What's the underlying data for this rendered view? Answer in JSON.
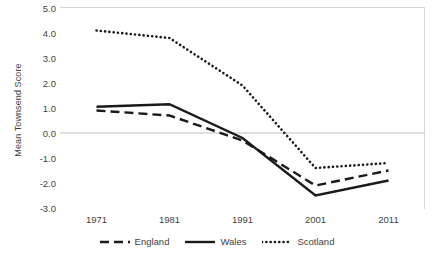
{
  "chart_data": {
    "type": "line",
    "title": "",
    "xlabel": "",
    "ylabel": "Mean Townsend Score",
    "categories": [
      "1971",
      "1981",
      "1991",
      "2001",
      "2011"
    ],
    "x": [
      1971,
      1981,
      1991,
      2001,
      2011
    ],
    "ylim": [
      -3.0,
      5.0
    ],
    "yticks": [
      "5.0",
      "4.0",
      "3.0",
      "2.0",
      "1.0",
      "0.0",
      "-1.0",
      "-2.0",
      "-3.0"
    ],
    "ytick_values": [
      5.0,
      4.0,
      3.0,
      2.0,
      1.0,
      0.0,
      -1.0,
      -2.0,
      -3.0
    ],
    "grid": false,
    "zero_line": true,
    "legend_position": "bottom",
    "series": [
      {
        "name": "England",
        "style": "dashed",
        "color": "#1a1a1a",
        "values": [
          0.9,
          0.7,
          -0.3,
          -2.1,
          -1.5
        ]
      },
      {
        "name": "Wales",
        "style": "solid",
        "color": "#1a1a1a",
        "values": [
          1.05,
          1.15,
          -0.2,
          -2.5,
          -1.9
        ]
      },
      {
        "name": "Scotland",
        "style": "dotted",
        "color": "#1a1a1a",
        "values": [
          4.1,
          3.8,
          1.9,
          -1.4,
          -1.2
        ]
      }
    ]
  },
  "colors": {
    "axis_line": "#bfbfbf",
    "frame": "#d9d9d9",
    "text": "#3f3f3f",
    "series": "#1a1a1a"
  }
}
